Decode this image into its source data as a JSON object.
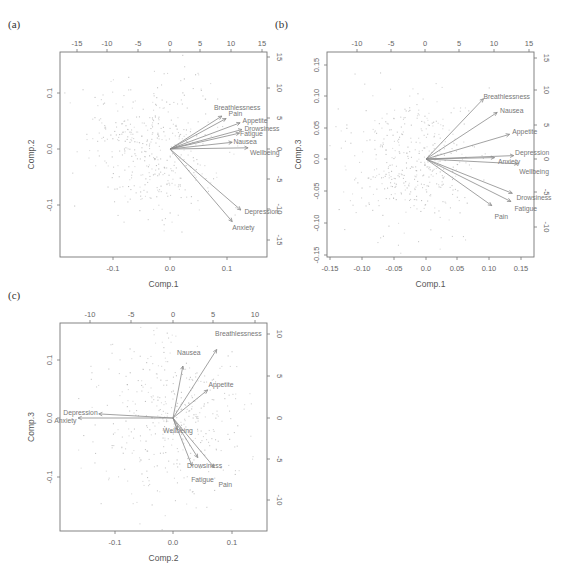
{
  "figure": {
    "panels": [
      {
        "tag": "(a)",
        "box": {
          "left": 60,
          "right": 267,
          "top": 52,
          "bottom": 257
        },
        "bottom_axis": {
          "title": "Comp.1",
          "ticks": [
            {
              "v": -0.1,
              "label": "-0.1",
              "px": 113
            },
            {
              "v": 0.0,
              "label": "0.0",
              "px": 170
            },
            {
              "v": 0.1,
              "label": "0.1",
              "px": 227
            }
          ]
        },
        "left_axis": {
          "title": "Comp.2",
          "ticks": [
            {
              "v": 0.1,
              "label": "0.1",
              "px": 93
            },
            {
              "v": 0.0,
              "label": "0.0",
              "px": 149
            },
            {
              "v": -0.1,
              "label": "-0.1",
              "px": 205
            }
          ]
        },
        "top_axis": {
          "ticks": [
            {
              "v": -15,
              "label": "-15",
              "px": 77
            },
            {
              "v": -10,
              "label": "-10",
              "px": 107
            },
            {
              "v": -5,
              "label": "-5",
              "px": 138
            },
            {
              "v": 0,
              "label": "0",
              "px": 170
            },
            {
              "v": 5,
              "label": "5",
              "px": 200
            },
            {
              "v": 10,
              "label": "10",
              "px": 231
            },
            {
              "v": 15,
              "label": "15",
              "px": 262
            }
          ]
        },
        "right_axis": {
          "ticks": [
            {
              "v": 15,
              "label": "15",
              "px": 57
            },
            {
              "v": 10,
              "label": "10",
              "px": 88
            },
            {
              "v": 5,
              "label": "5",
              "px": 118
            },
            {
              "v": 0,
              "label": "0",
              "px": 149
            },
            {
              "v": -5,
              "label": "-5",
              "px": 179
            },
            {
              "v": -10,
              "label": "-10",
              "px": 209
            },
            {
              "v": -15,
              "label": "-15",
              "px": 240
            }
          ]
        },
        "origin": {
          "x": 170,
          "y": 149
        },
        "scale_px_per_unit": 6.1,
        "scatter_seed": 11,
        "scatter_spread": {
          "sx": 34,
          "sy": 33,
          "cx": -14,
          "cy": 0
        },
        "arrows": [
          {
            "name": "Breathlessness",
            "x": 8.5,
            "y": 5.4,
            "lx": 7.2,
            "ly": 6.8
          },
          {
            "name": "Pain",
            "x": 9.2,
            "y": 5.0,
            "lx": 9.6,
            "ly": 5.9
          },
          {
            "name": "Appetite",
            "x": 11.5,
            "y": 4.3,
            "lx": 11.9,
            "ly": 4.6
          },
          {
            "name": "Drowsiness",
            "x": 11.8,
            "y": 3.2,
            "lx": 12.2,
            "ly": 3.4
          },
          {
            "name": "Fatigue",
            "x": 11.4,
            "y": 2.6,
            "lx": 11.5,
            "ly": 2.5
          },
          {
            "name": "Nausea",
            "x": 10.2,
            "y": 1.1,
            "lx": 10.4,
            "ly": 1.2
          },
          {
            "name": "Wellbeing",
            "x": 12.8,
            "y": 0.2,
            "lx": 13.1,
            "ly": -0.6
          },
          {
            "name": "Depression",
            "x": 11.6,
            "y": -10.0,
            "lx": 12.2,
            "ly": -10.2
          },
          {
            "name": "Anxiety",
            "x": 10.2,
            "y": -11.9,
            "lx": 10.2,
            "ly": -12.9
          }
        ]
      },
      {
        "tag": "(b)",
        "box": {
          "left": 327,
          "right": 534,
          "top": 52,
          "bottom": 257
        },
        "bottom_axis": {
          "title": "Comp.1",
          "ticks": [
            {
              "v": -0.15,
              "label": "-0.15",
              "px": 330
            },
            {
              "v": -0.1,
              "label": "-0.10",
              "px": 362
            },
            {
              "v": -0.05,
              "label": "-0.05",
              "px": 394
            },
            {
              "v": 0.0,
              "label": "0.0",
              "px": 426
            },
            {
              "v": 0.05,
              "label": "0.05",
              "px": 457
            },
            {
              "v": 0.1,
              "label": "0.10",
              "px": 489
            },
            {
              "v": 0.15,
              "label": "0.15",
              "px": 521
            }
          ]
        },
        "left_axis": {
          "title": "Comp.3",
          "ticks": [
            {
              "v": 0.15,
              "label": "0.15",
              "px": 65
            },
            {
              "v": 0.1,
              "label": "0.10",
              "px": 96
            },
            {
              "v": 0.05,
              "label": "0.05",
              "px": 128
            },
            {
              "v": 0.0,
              "label": "0.0",
              "px": 159
            },
            {
              "v": -0.05,
              "label": "-0.05",
              "px": 191
            },
            {
              "v": -0.1,
              "label": "-0.10",
              "px": 223
            },
            {
              "v": -0.15,
              "label": "-0.15",
              "px": 255
            }
          ]
        },
        "top_axis": {
          "ticks": [
            {
              "v": -10,
              "label": "-10",
              "px": 357
            },
            {
              "v": -5,
              "label": "-5",
              "px": 391
            },
            {
              "v": 0,
              "label": "0",
              "px": 425
            },
            {
              "v": 5,
              "label": "5",
              "px": 459
            },
            {
              "v": 10,
              "label": "10",
              "px": 494
            },
            {
              "v": 15,
              "label": "15",
              "px": 529
            }
          ]
        },
        "right_axis": {
          "ticks": [
            {
              "v": 15,
              "label": "15",
              "px": 58
            },
            {
              "v": 10,
              "label": "10",
              "px": 90
            },
            {
              "v": 5,
              "label": "5",
              "px": 125
            },
            {
              "v": 0,
              "label": "0",
              "px": 159
            },
            {
              "v": -5,
              "label": "-5",
              "px": 192
            },
            {
              "v": -10,
              "label": "-10",
              "px": 227
            }
          ]
        },
        "origin": {
          "x": 426,
          "y": 159
        },
        "scale_px_per_unit": 6.85,
        "scatter_seed": 23,
        "scatter_spread": {
          "sx": 30,
          "sy": 34,
          "cx": -14,
          "cy": 0
        },
        "arrows": [
          {
            "name": "Breathlessness",
            "x": 8.4,
            "y": 8.8,
            "lx": 8.4,
            "ly": 9.2
          },
          {
            "name": "Nausea",
            "x": 10.4,
            "y": 6.8,
            "lx": 10.8,
            "ly": 7.1
          },
          {
            "name": "Appetite",
            "x": 12.2,
            "y": 3.6,
            "lx": 12.6,
            "ly": 4.0
          },
          {
            "name": "Depression",
            "x": 12.8,
            "y": 0.5,
            "lx": 13.0,
            "ly": 0.9
          },
          {
            "name": "Anxiety",
            "x": 10.0,
            "y": 0.2,
            "lx": 10.5,
            "ly": -0.3
          },
          {
            "name": "Wellbeing",
            "x": 13.4,
            "y": -0.7,
            "lx": 13.6,
            "ly": -1.8
          },
          {
            "name": "Drowsiness",
            "x": 12.6,
            "y": -5.0,
            "lx": 13.2,
            "ly": -5.6
          },
          {
            "name": "Fatigue",
            "x": 12.4,
            "y": -6.2,
            "lx": 12.9,
            "ly": -7.2
          },
          {
            "name": "Pain",
            "x": 9.6,
            "y": -6.8,
            "lx": 10.0,
            "ly": -8.4
          }
        ]
      },
      {
        "tag": "(c)",
        "box": {
          "left": 60,
          "right": 267,
          "top": 323,
          "bottom": 531
        },
        "bottom_axis": {
          "title": "Comp.2",
          "ticks": [
            {
              "v": -0.1,
              "label": "-0.1",
              "px": 115
            },
            {
              "v": 0.0,
              "label": "0.0",
              "px": 173
            },
            {
              "v": 0.1,
              "label": "0.1",
              "px": 232
            }
          ]
        },
        "left_axis": {
          "title": "Comp.3",
          "ticks": [
            {
              "v": 0.1,
              "label": "0.1",
              "px": 360
            },
            {
              "v": 0.0,
              "label": "0.0",
              "px": 418
            },
            {
              "v": -0.1,
              "label": "-0.1",
              "px": 477
            }
          ]
        },
        "top_axis": {
          "ticks": [
            {
              "v": -10,
              "label": "-10",
              "px": 90
            },
            {
              "v": -5,
              "label": "-5",
              "px": 131
            },
            {
              "v": 0,
              "label": "0",
              "px": 173
            },
            {
              "v": 5,
              "label": "5",
              "px": 213
            },
            {
              "v": 10,
              "label": "10",
              "px": 255
            }
          ]
        },
        "right_axis": {
          "ticks": [
            {
              "v": 10,
              "label": "10",
              "px": 334
            },
            {
              "v": 5,
              "label": "5",
              "px": 376
            },
            {
              "v": 0,
              "label": "0",
              "px": 418
            },
            {
              "v": -5,
              "label": "-5",
              "px": 459
            },
            {
              "v": -10,
              "label": "-10",
              "px": 500
            }
          ]
        },
        "origin": {
          "x": 173,
          "y": 418
        },
        "scale_px_per_unit": 8.25,
        "scatter_seed": 37,
        "scatter_spread": {
          "sx": 38,
          "sy": 40,
          "cx": 0,
          "cy": 0
        },
        "arrows": [
          {
            "name": "Breathlessness",
            "x": 5.3,
            "y": 8.3,
            "lx": 5.1,
            "ly": 10.2
          },
          {
            "name": "Nausea",
            "x": 1.2,
            "y": 6.3,
            "lx": 0.5,
            "ly": 7.9
          },
          {
            "name": "Appetite",
            "x": 4.2,
            "y": 3.4,
            "lx": 4.3,
            "ly": 4.1
          },
          {
            "name": "Depression",
            "x": -9.0,
            "y": 0.5,
            "lx": -13.3,
            "ly": 0.7
          },
          {
            "name": "Anxiety",
            "x": -11.5,
            "y": 0.0,
            "lx": -14.4,
            "ly": -0.3
          },
          {
            "name": "Wellbeing",
            "x": 0.5,
            "y": -1.4,
            "lx": -1.2,
            "ly": -1.5
          },
          {
            "name": "Drowsiness",
            "x": 3.0,
            "y": -4.8,
            "lx": 1.7,
            "ly": -5.8
          },
          {
            "name": "Fatigue",
            "x": 2.3,
            "y": -5.8,
            "lx": 2.2,
            "ly": -7.4
          },
          {
            "name": "Pain",
            "x": 5.0,
            "y": -6.0,
            "lx": 5.5,
            "ly": -8.1
          }
        ]
      }
    ]
  },
  "chart_data": [
    {
      "type": "scatter",
      "title": "(a) Biplot Comp.1 vs Comp.2",
      "xlabel": "Comp.1",
      "ylabel": "Comp.2",
      "xlim": [
        -0.19,
        0.17
      ],
      "ylim": [
        -0.19,
        0.17
      ],
      "secondary_xlim": [
        -18,
        16
      ],
      "secondary_ylim": [
        -18,
        17
      ],
      "x_ticks": [
        -0.1,
        0.0,
        0.1
      ],
      "y_ticks": [
        -0.1,
        0.0,
        0.1
      ],
      "secondary_x_ticks": [
        -15,
        -10,
        -5,
        0,
        5,
        10,
        15
      ],
      "secondary_y_ticks": [
        -15,
        -10,
        -5,
        0,
        5,
        10,
        15
      ],
      "loadings": [
        {
          "variable": "Breathlessness",
          "x": 8.5,
          "y": 5.4
        },
        {
          "variable": "Pain",
          "x": 9.2,
          "y": 5.0
        },
        {
          "variable": "Appetite",
          "x": 11.5,
          "y": 4.3
        },
        {
          "variable": "Drowsiness",
          "x": 11.8,
          "y": 3.2
        },
        {
          "variable": "Fatigue",
          "x": 11.4,
          "y": 2.6
        },
        {
          "variable": "Nausea",
          "x": 10.2,
          "y": 1.1
        },
        {
          "variable": "Wellbeing",
          "x": 12.8,
          "y": 0.2
        },
        {
          "variable": "Depression",
          "x": 11.6,
          "y": -10.0
        },
        {
          "variable": "Anxiety",
          "x": 10.2,
          "y": -11.9
        }
      ],
      "grid": false,
      "legend": "none"
    },
    {
      "type": "scatter",
      "title": "(b) Biplot Comp.1 vs Comp.3",
      "xlabel": "Comp.1",
      "ylabel": "Comp.3",
      "xlim": [
        -0.16,
        0.17
      ],
      "ylim": [
        -0.16,
        0.17
      ],
      "secondary_xlim": [
        -13,
        16
      ],
      "secondary_ylim": [
        -14,
        16
      ],
      "x_ticks": [
        -0.15,
        -0.1,
        -0.05,
        0.0,
        0.05,
        0.1,
        0.15
      ],
      "y_ticks": [
        -0.15,
        -0.1,
        -0.05,
        0.0,
        0.05,
        0.1,
        0.15
      ],
      "secondary_x_ticks": [
        -10,
        -5,
        0,
        5,
        10,
        15
      ],
      "secondary_y_ticks": [
        -10,
        -5,
        0,
        5,
        10,
        15
      ],
      "loadings": [
        {
          "variable": "Breathlessness",
          "x": 8.4,
          "y": 8.8
        },
        {
          "variable": "Nausea",
          "x": 10.4,
          "y": 6.8
        },
        {
          "variable": "Appetite",
          "x": 12.2,
          "y": 3.6
        },
        {
          "variable": "Depression",
          "x": 12.8,
          "y": 0.5
        },
        {
          "variable": "Anxiety",
          "x": 10.0,
          "y": 0.2
        },
        {
          "variable": "Wellbeing",
          "x": 13.4,
          "y": -0.7
        },
        {
          "variable": "Drowsiness",
          "x": 12.6,
          "y": -5.0
        },
        {
          "variable": "Fatigue",
          "x": 12.4,
          "y": -6.2
        },
        {
          "variable": "Pain",
          "x": 9.6,
          "y": -6.8
        }
      ],
      "grid": false,
      "legend": "none"
    },
    {
      "type": "scatter",
      "title": "(c) Biplot Comp.2 vs Comp.3",
      "xlabel": "Comp.2",
      "ylabel": "Comp.3",
      "xlim": [
        -0.19,
        0.16
      ],
      "ylim": [
        -0.19,
        0.16
      ],
      "secondary_xlim": [
        -14,
        12
      ],
      "secondary_ylim": [
        -14,
        12
      ],
      "x_ticks": [
        -0.1,
        0.0,
        0.1
      ],
      "y_ticks": [
        -0.1,
        0.0,
        0.1
      ],
      "secondary_x_ticks": [
        -10,
        -5,
        0,
        5,
        10
      ],
      "secondary_y_ticks": [
        -10,
        -5,
        0,
        5,
        10
      ],
      "loadings": [
        {
          "variable": "Breathlessness",
          "x": 5.3,
          "y": 8.3
        },
        {
          "variable": "Nausea",
          "x": 1.2,
          "y": 6.3
        },
        {
          "variable": "Appetite",
          "x": 4.2,
          "y": 3.4
        },
        {
          "variable": "Depression",
          "x": -9.0,
          "y": 0.5
        },
        {
          "variable": "Anxiety",
          "x": -11.5,
          "y": 0.0
        },
        {
          "variable": "Wellbeing",
          "x": 0.5,
          "y": -1.4
        },
        {
          "variable": "Drowsiness",
          "x": 3.0,
          "y": -4.8
        },
        {
          "variable": "Fatigue",
          "x": 2.3,
          "y": -5.8
        },
        {
          "variable": "Pain",
          "x": 5.0,
          "y": -6.0
        }
      ],
      "grid": false,
      "legend": "none"
    }
  ]
}
